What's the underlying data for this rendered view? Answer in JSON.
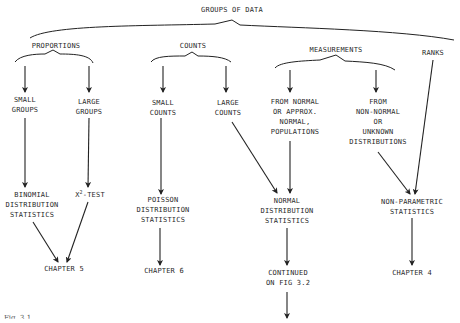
{
  "diagram": {
    "root": "GROUPS OF DATA",
    "categories": {
      "proportions": "PROPORTIONS",
      "counts": "COUNTS",
      "measurements": "MEASUREMENTS",
      "ranks": "RANKS"
    },
    "subgroups": {
      "small_groups": "SMALL\nGROUPS",
      "large_groups": "LARGE\nGROUPS",
      "small_counts": "SMALL\nCOUNTS",
      "large_counts": "LARGE\nCOUNTS",
      "from_normal": "FROM NORMAL\nOR APPROX.\nNORMAL,\nPOPULATIONS",
      "from_non_normal": "FROM\nNON-NORMAL\nOR\nUNKNOWN\nDISTRIBUTIONS"
    },
    "methods": {
      "binomial": "BINOMIAL\nDISTRIBUTION\nSTATISTICS",
      "chi_square_base": "X",
      "chi_square_sup": "2",
      "chi_square_rest": "-TEST",
      "poisson": "POISSON\nDISTRIBUTION\nSTATISTICS",
      "normal": "NORMAL\nDISTRIBUTION\nSTATISTICS",
      "non_parametric": "NON-PARAMETRIC\nSTATISTICS"
    },
    "outcomes": {
      "chapter5": "CHAPTER 5",
      "chapter6": "CHAPTER 6",
      "continued": "CONTINUED\nON FIG 3.2",
      "chapter4": "CHAPTER 4"
    },
    "caption": "Fig. 3.1"
  }
}
